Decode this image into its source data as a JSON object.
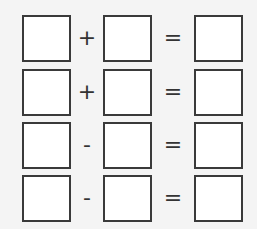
{
  "worksheet": {
    "rows": [
      {
        "operator": "+",
        "equals": "="
      },
      {
        "operator": "+",
        "equals": "="
      },
      {
        "operator": "-",
        "equals": "="
      },
      {
        "operator": "-",
        "equals": "="
      }
    ]
  },
  "colors": {
    "background": "#f4f4f4",
    "box_border": "#3a3a3a",
    "box_fill": "#ffffff"
  }
}
